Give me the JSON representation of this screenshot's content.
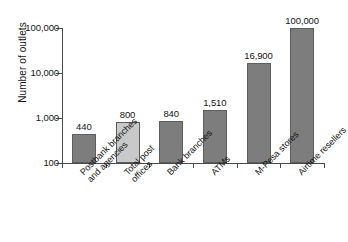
{
  "chart_data": {
    "type": "bar",
    "title": "",
    "xlabel": "",
    "ylabel": "Number of outlets",
    "yscale": "log",
    "ylim": [
      100,
      100000
    ],
    "grid": false,
    "legend": null,
    "ytick_labels": [
      "100,000",
      "10,000",
      "1,000",
      "100"
    ],
    "ytick_values": [
      100000,
      10000,
      1000,
      100
    ],
    "categories": [
      "Postbank branches and agencies",
      "Total post offices",
      "Bank branches",
      "ATMs",
      "M-Pesa stores",
      "Airtime resellers"
    ],
    "category_lines": [
      [
        "Postbank branches",
        "and agencies"
      ],
      [
        "Total post",
        "offices"
      ],
      [
        "Bank branches"
      ],
      [
        "ATMs"
      ],
      [
        "M-Pesa stores"
      ],
      [
        "Airtime resellers"
      ]
    ],
    "values": [
      440,
      800,
      840,
      1510,
      16900,
      100000
    ],
    "value_labels": [
      "440",
      "800",
      "840",
      "1,510",
      "16,900",
      "100,000"
    ],
    "bar_colors": [
      "#7d7d7d",
      "#c9c9c9",
      "#7d7d7d",
      "#7d7d7d",
      "#7d7d7d",
      "#7d7d7d"
    ],
    "bar_edge_color": "#5d5d5d",
    "axis_color": "#4a4a4a",
    "text_color": "#141414",
    "background": "#ffffff"
  }
}
